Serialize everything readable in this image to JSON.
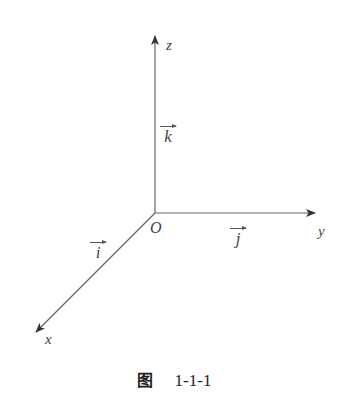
{
  "figure": {
    "axes": {
      "z": {
        "label": "z"
      },
      "y": {
        "label": "y"
      },
      "x": {
        "label": "x"
      }
    },
    "origin_label": "O",
    "unit_vectors": {
      "k": "k",
      "j": "j",
      "i": "i"
    },
    "caption": {
      "prefix": "图",
      "number": "1-1-1"
    },
    "line_color": "#555555"
  }
}
